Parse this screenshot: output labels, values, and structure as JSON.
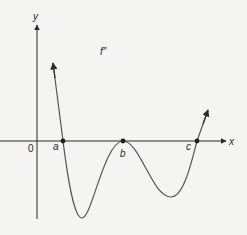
{
  "figure": {
    "function_label": "f″",
    "axes": {
      "x_label": "x",
      "y_label": "y",
      "origin_label": "0"
    },
    "points": [
      {
        "name": "a",
        "label": "a"
      },
      {
        "name": "b",
        "label": "b"
      },
      {
        "name": "c",
        "label": "c"
      }
    ],
    "colors": {
      "background": "#f4f4f2",
      "ink": "#2b2b2b",
      "curve": "#555555"
    }
  }
}
